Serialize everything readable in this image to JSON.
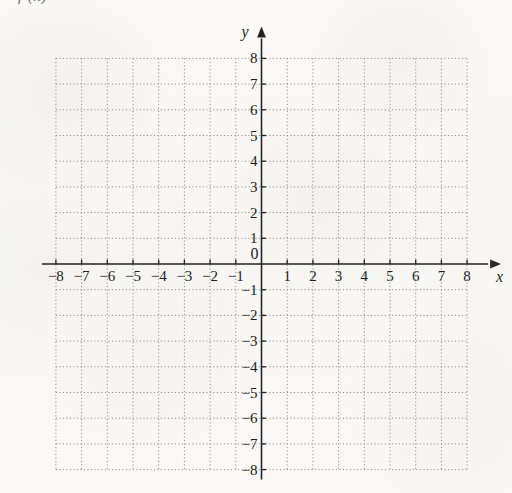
{
  "header": {
    "clipped_text": "f (x)"
  },
  "chart_data": {
    "type": "scatter",
    "title": "",
    "subtitle": "",
    "xlabel": "x",
    "ylabel": "y",
    "xlim": [
      -8,
      8
    ],
    "ylim": [
      -8,
      8
    ],
    "grid": true,
    "grid_style": "dotted",
    "grid_step": 1,
    "legend": null,
    "series": [],
    "annotations": [],
    "x_tick_labels": [
      "-8",
      "-7",
      "-6",
      "-5",
      "-4",
      "-3",
      "-2",
      "-1",
      "1",
      "2",
      "3",
      "4",
      "5",
      "6",
      "7",
      "8"
    ],
    "y_tick_labels": [
      "8",
      "7",
      "6",
      "5",
      "4",
      "3",
      "2",
      "1",
      "-1",
      "-2",
      "-3",
      "-4",
      "-5",
      "-6",
      "-7",
      "-8"
    ],
    "origin_label": "0",
    "x_ticks": [
      -8,
      -7,
      -6,
      -5,
      -4,
      -3,
      -2,
      -1,
      1,
      2,
      3,
      4,
      5,
      6,
      7,
      8
    ],
    "y_ticks": [
      8,
      7,
      6,
      5,
      4,
      3,
      2,
      1,
      -1,
      -2,
      -3,
      -4,
      -5,
      -6,
      -7,
      -8
    ],
    "axis_arrows": {
      "x": "right",
      "y": "up"
    },
    "colors": {
      "background": "#faf9f7",
      "grid": "#8e8b87",
      "axis": "#24221f",
      "text": "#201e1c"
    }
  },
  "axis_names": {
    "x": "x",
    "y": "y"
  }
}
